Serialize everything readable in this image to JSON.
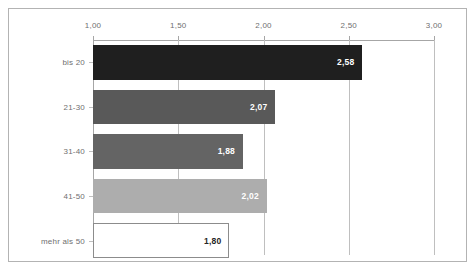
{
  "chart_data": {
    "type": "bar",
    "orientation": "horizontal",
    "title": "",
    "subtitle": "",
    "xlabel": "",
    "ylabel": "",
    "categories": [
      "bis 20",
      "21-30",
      "31-40",
      "41-50",
      "mehr als 50"
    ],
    "values": [
      2.58,
      2.07,
      1.88,
      2.02,
      1.8
    ],
    "value_labels": [
      "2,58",
      "2,07",
      "1,88",
      "2,02",
      "1,80"
    ],
    "xlim": [
      1.0,
      3.0
    ],
    "xticks": [
      1.0,
      1.5,
      2.0,
      2.5,
      3.0
    ],
    "xtick_labels": [
      "1,00",
      "1,50",
      "2,00",
      "2,50",
      "3,00"
    ],
    "grid": true,
    "grid_axis": "x",
    "legend": false,
    "legend_position": "none",
    "bar_colors": [
      "#1f1f1f",
      "#595959",
      "#646464",
      "#adadad",
      "#ffffff"
    ],
    "bar_border_colors": [
      "#1f1f1f",
      "#595959",
      "#646464",
      "#adadad",
      "#8c8c8c"
    ],
    "label_colors": [
      "#ffffff",
      "#ffffff",
      "#ffffff",
      "#ffffff",
      "#262626"
    ],
    "axis_color": "#a6a6a6",
    "grid_color": "#bfbfbf",
    "tick_label_color": "#6f6f6f",
    "frame_color": "#b3b3b3",
    "background": "#ffffff"
  }
}
